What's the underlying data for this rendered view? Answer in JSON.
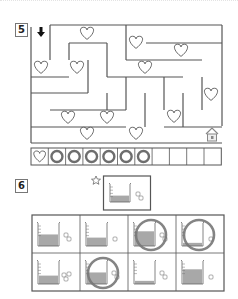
{
  "page": {
    "questions": [
      {
        "number": "5",
        "type": "maze"
      },
      {
        "number": "6",
        "type": "beaker-comparison"
      }
    ]
  },
  "maze": {
    "start_icon": "down-arrow-icon",
    "goal_icon": "house-icon",
    "heart_count": 13,
    "tracker": {
      "total_cells": 11,
      "first_cell_icon": "heart-icon",
      "circled_cells": 6
    }
  },
  "beakers": {
    "reference": {
      "marker_icon": "star-icon",
      "fill_level": 0.4,
      "sugar_cubes": 2
    },
    "options": [
      {
        "fill_level": 0.55,
        "sugar_cubes": 2,
        "circled": false
      },
      {
        "fill_level": 0.4,
        "sugar_cubes": 1,
        "circled": false
      },
      {
        "fill_level": 0.7,
        "sugar_cubes": 2,
        "circled": true
      },
      {
        "fill_level": 0.15,
        "sugar_cubes": 1,
        "circled": true
      },
      {
        "fill_level": 0.4,
        "sugar_cubes": 3,
        "circled": false
      },
      {
        "fill_level": 0.55,
        "sugar_cubes": 2,
        "circled": true
      },
      {
        "fill_level": 0.15,
        "sugar_cubes": 2,
        "circled": false
      },
      {
        "fill_level": 0.7,
        "sugar_cubes": 1,
        "circled": false
      }
    ]
  },
  "colors": {
    "line": "#555555",
    "water": "#a8a8a8",
    "circle": "#777777"
  }
}
